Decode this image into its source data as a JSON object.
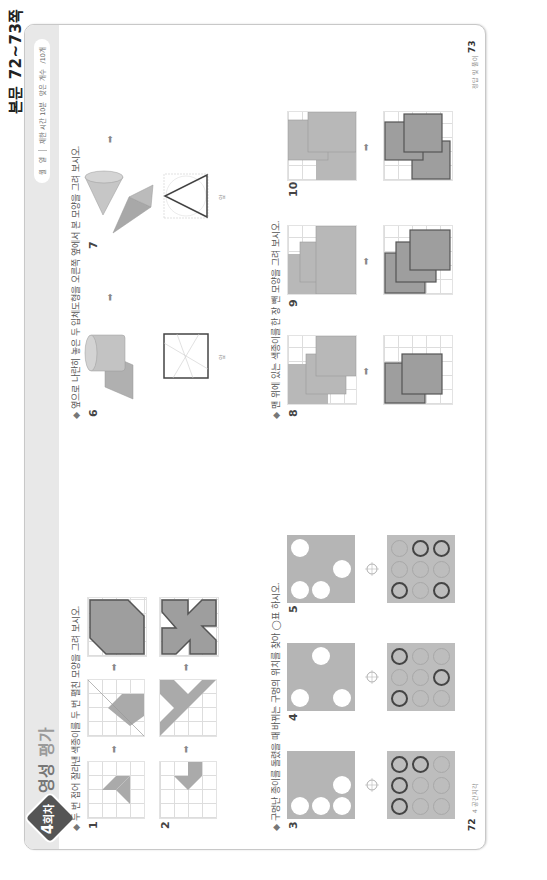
{
  "reference_label": "본문 72~73쪽",
  "header": {
    "badge_number": "4",
    "badge_unit": "회차",
    "title_part1": "영성",
    "title_part2": "평가",
    "pill": {
      "month": "월",
      "day": "일",
      "time_limit": "제한 시간 10분",
      "correct_count": "맞은 개수",
      "total": "/10개"
    }
  },
  "sections": [
    {
      "id": "fold-cut",
      "prompt": "두 번 접어 잘라낸 색종이를 두 번 펼친 모양을 그려 보시오.",
      "problems": [
        {
          "number": "1"
        },
        {
          "number": "2"
        }
      ]
    },
    {
      "id": "punch-holes",
      "prompt": "구멍난 종이를 돌렸을 때 바뀌는 구멍의 위치를 찾아 ◯표 하시오.",
      "problems": [
        {
          "number": "3"
        },
        {
          "number": "4"
        },
        {
          "number": "5"
        }
      ]
    },
    {
      "id": "solids-front-view",
      "prompt": "옆으로 나란히 놓은 두 입체도형을 오른쪽 옆에서 본 모양을 그려 보시오.",
      "problems": [
        {
          "number": "6",
          "view_label": "앞"
        },
        {
          "number": "7",
          "view_label": "앞"
        }
      ]
    },
    {
      "id": "stacked-papers",
      "prompt": "맨 위에 있는 색종이를 한 장 뺀 모양을 그려 보시오.",
      "problems": [
        {
          "number": "8"
        },
        {
          "number": "9"
        },
        {
          "number": "10"
        }
      ]
    }
  ],
  "footer": {
    "left_page": "72",
    "left_text": "4 공간지각",
    "right_page": "73",
    "right_text": "정답 및 풀이"
  },
  "arrow_glyph": "➡",
  "colors": {
    "header_bg": "#e8e8e8",
    "badge": "#555555",
    "shape_fill": "#9e9e9e",
    "paper_fill": "#b5b5b5"
  }
}
